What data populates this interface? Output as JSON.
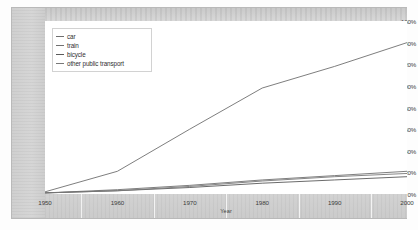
{
  "chart_data": {
    "type": "line",
    "title": "",
    "xlabel": "Year",
    "ylabel": "",
    "xlim": [
      1950,
      2000
    ],
    "ylim": [
      0,
      160
    ],
    "grid": false,
    "legend_position": "top-left",
    "x": [
      1950,
      1960,
      1970,
      1980,
      1990,
      2000
    ],
    "x_ticklabels": [
      "1950",
      "1960",
      "1970",
      "1980",
      "1990",
      "2000"
    ],
    "y_ticklabels": [
      "0%",
      "20%",
      "40%",
      "60%",
      "80%",
      "100%",
      "120%",
      "140%",
      "160%"
    ],
    "y_tickvalues": [
      0,
      20,
      40,
      60,
      80,
      100,
      120,
      140,
      160
    ],
    "series": [
      {
        "name": "car",
        "color": "#6f6f6f",
        "values": [
          2,
          21,
          60,
          98,
          118,
          140
        ]
      },
      {
        "name": "train",
        "color": "#707070",
        "values": [
          1,
          4,
          8,
          13,
          17,
          21
        ]
      },
      {
        "name": "bicycle",
        "color": "#5a5a5a",
        "values": [
          1,
          3,
          6,
          10,
          13,
          16
        ]
      },
      {
        "name": "other public transport",
        "color": "#787878",
        "values": [
          1,
          3,
          7,
          12,
          16,
          19
        ]
      }
    ]
  },
  "legend": {
    "items": [
      {
        "label": "car"
      },
      {
        "label": "train"
      },
      {
        "label": "bicycle"
      },
      {
        "label": "other public transport"
      }
    ]
  },
  "axes": {
    "x_title": "Year"
  },
  "colors": {
    "frame": "#b9b9b9",
    "band": "#d2d2d2",
    "text": "#3c3c3c",
    "plot_background": "#ffffff"
  }
}
